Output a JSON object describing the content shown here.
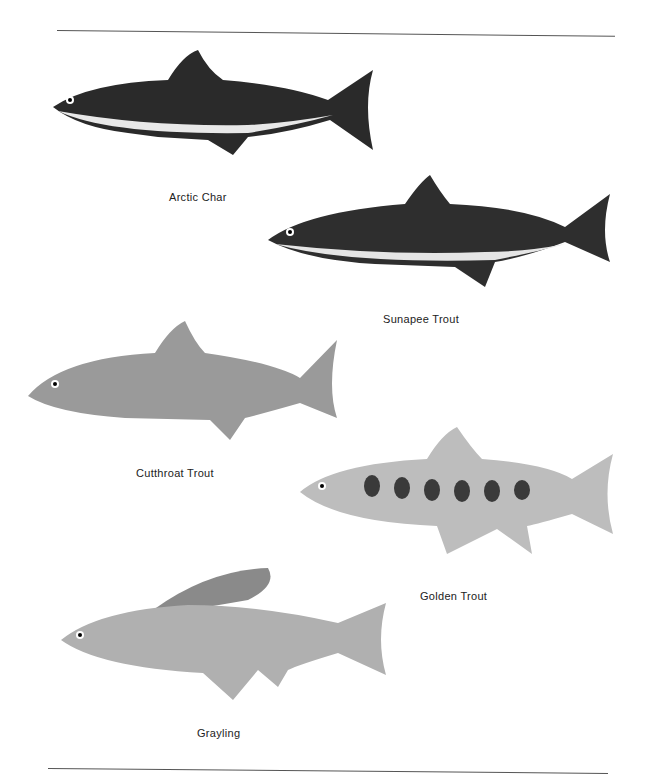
{
  "page": {
    "page_number": "",
    "fish": [
      {
        "name": "Arctic Char"
      },
      {
        "name": "Sunapee Trout"
      },
      {
        "name": "Cutthroat Trout"
      },
      {
        "name": "Golden Trout"
      },
      {
        "name": "Grayling"
      }
    ]
  }
}
